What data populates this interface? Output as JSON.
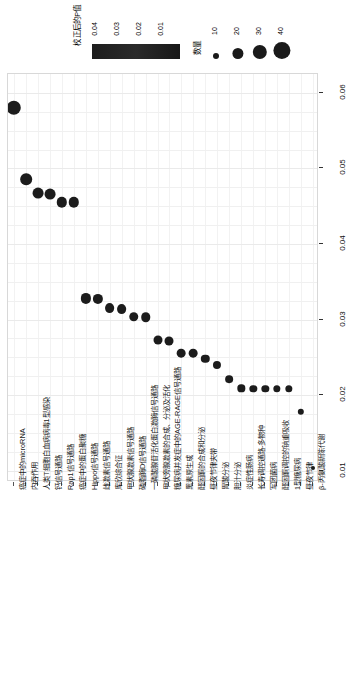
{
  "legends": {
    "color": {
      "title": "校正后的P值",
      "ticks": [
        "0.04",
        "0.03",
        "0.02",
        "0.01"
      ],
      "gradient_from": "#1d1d1d",
      "gradient_to": "#171717"
    },
    "size": {
      "title": "数量",
      "ticks": [
        "10",
        "20",
        "30",
        "40"
      ],
      "dot_color": "#1a1a1a"
    }
  },
  "axes": {
    "y_label": "",
    "y_ticks": [
      "0.06",
      "0.05",
      "0.04",
      "0.03",
      "0.02",
      "0.01"
    ],
    "y_min": 0.0085,
    "y_max": 0.0625,
    "x_label": ""
  },
  "chart_data": {
    "type": "scatter",
    "title": "",
    "xlabel": "",
    "ylabel": "校正后的P值",
    "ylim": [
      0.0085,
      0.0625
    ],
    "grid": true,
    "legend_position": "top",
    "orientation": "categories-on-x-rotated-labels",
    "size_legend_name": "数量",
    "color_legend_name": "校正后的P值",
    "categories": [
      "癌症中的microRNA",
      "内吞作用",
      "人类T细胞白血病病毒1型感染",
      "钙信号通路",
      "Rap1信号通路",
      "癌症中的蛋白聚糖",
      "Hippo信号通路",
      "雌激素信号通路",
      "库欣综合征",
      "甲状腺激素信号通路",
      "磷脂酶D信号通路",
      "一磷酸腺苷活化蛋白激酶信号通路",
      "甲状旁腺激素的合成、分泌及活化",
      "糖尿病并发症中的AGE-RAGE信号通路",
      "黑素原生成",
      "醛固酮的合成和分泌",
      "昼夜节律夹带",
      "胃酸分泌",
      "胆汁分泌",
      "炎症性肠病",
      "长寿调控通路-多物种",
      "军团菌病",
      "醛固酮调控的钠重吸收",
      "1型糖尿病",
      "昼夜节律",
      "β-丙氨酸新陈代谢"
    ],
    "values": [
      0.058,
      0.0486,
      0.0467,
      0.0466,
      0.0455,
      0.0455,
      0.0328,
      0.0327,
      0.0315,
      0.0314,
      0.0304,
      0.0303,
      0.0273,
      0.0272,
      0.0256,
      0.0256,
      0.0248,
      0.024,
      0.0221,
      0.0209,
      0.0208,
      0.0208,
      0.0208,
      0.0208,
      0.0178,
      0.0104
    ],
    "counts": [
      44,
      26,
      22,
      22,
      20,
      20,
      19,
      19,
      17,
      17,
      16,
      16,
      14,
      14,
      13,
      13,
      12,
      11,
      10,
      9,
      9,
      9,
      9,
      9,
      7,
      5
    ]
  }
}
